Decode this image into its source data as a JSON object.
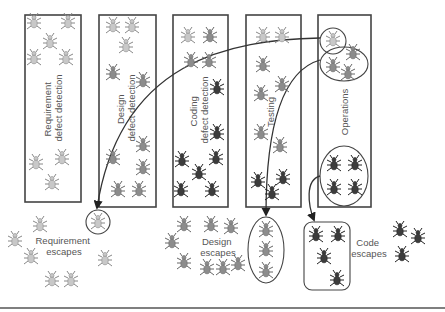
{
  "phases": [
    {
      "id": "requirement",
      "label_lines": [
        "Requirement",
        "defect detection"
      ]
    },
    {
      "id": "design",
      "label_lines": [
        "Design",
        "defect detection"
      ]
    },
    {
      "id": "coding",
      "label_lines": [
        "Coding",
        "defect detection"
      ]
    },
    {
      "id": "testing",
      "label_lines": [
        "Testing"
      ]
    },
    {
      "id": "operations",
      "label_lines": [
        "Operations"
      ]
    }
  ],
  "escapes": [
    {
      "id": "requirement",
      "label_lines": [
        "Requirement",
        "escapes"
      ]
    },
    {
      "id": "design",
      "label_lines": [
        "Design",
        "escapes"
      ]
    },
    {
      "id": "code",
      "label_lines": [
        "Code",
        "escapes"
      ]
    }
  ],
  "bug_colors": {
    "requirement": "#c8c8c8",
    "design": "#8c8c8c",
    "code": "#3c3c3c"
  },
  "bugs": [
    {
      "g": "requirement",
      "box": "requirement",
      "p": [
        34,
        22
      ]
    },
    {
      "g": "requirement",
      "box": "requirement",
      "p": [
        68,
        22
      ]
    },
    {
      "g": "requirement",
      "box": "requirement",
      "p": [
        50,
        42
      ]
    },
    {
      "g": "requirement",
      "box": "requirement",
      "p": [
        34,
        58
      ]
    },
    {
      "g": "requirement",
      "box": "requirement",
      "p": [
        66,
        58
      ]
    },
    {
      "g": "requirement",
      "box": "requirement",
      "p": [
        36,
        163
      ]
    },
    {
      "g": "requirement",
      "box": "requirement",
      "p": [
        62,
        158
      ]
    },
    {
      "g": "requirement",
      "box": "requirement",
      "p": [
        52,
        183
      ]
    },
    {
      "g": "requirement",
      "box": "design",
      "p": [
        113,
        26
      ]
    },
    {
      "g": "requirement",
      "box": "design",
      "p": [
        132,
        26
      ]
    },
    {
      "g": "requirement",
      "box": "design",
      "p": [
        126,
        46
      ]
    },
    {
      "g": "design",
      "box": "design",
      "p": [
        113,
        73
      ]
    },
    {
      "g": "design",
      "box": "design",
      "p": [
        143,
        81
      ]
    },
    {
      "g": "design",
      "box": "design",
      "p": [
        113,
        158
      ]
    },
    {
      "g": "design",
      "box": "design",
      "p": [
        143,
        145
      ]
    },
    {
      "g": "design",
      "box": "design",
      "p": [
        143,
        168
      ]
    },
    {
      "g": "design",
      "box": "design",
      "p": [
        118,
        190
      ]
    },
    {
      "g": "design",
      "box": "design",
      "p": [
        139,
        190
      ]
    },
    {
      "g": "requirement",
      "box": "coding",
      "p": [
        188,
        36
      ]
    },
    {
      "g": "design",
      "box": "coding",
      "p": [
        210,
        36
      ]
    },
    {
      "g": "design",
      "box": "coding",
      "p": [
        191,
        61
      ]
    },
    {
      "g": "design",
      "box": "coding",
      "p": [
        209,
        61
      ]
    },
    {
      "g": "code",
      "box": "coding",
      "p": [
        217,
        88
      ]
    },
    {
      "g": "code",
      "box": "coding",
      "p": [
        217,
        133
      ]
    },
    {
      "g": "code",
      "box": "coding",
      "p": [
        216,
        158
      ]
    },
    {
      "g": "code",
      "box": "coding",
      "p": [
        182,
        160
      ]
    },
    {
      "g": "code",
      "box": "coding",
      "p": [
        199,
        173
      ]
    },
    {
      "g": "code",
      "box": "coding",
      "p": [
        181,
        190
      ]
    },
    {
      "g": "code",
      "box": "coding",
      "p": [
        212,
        190
      ]
    },
    {
      "g": "requirement",
      "box": "testing",
      "p": [
        263,
        36
      ]
    },
    {
      "g": "requirement",
      "box": "testing",
      "p": [
        282,
        36
      ]
    },
    {
      "g": "design",
      "box": "testing",
      "p": [
        263,
        65
      ]
    },
    {
      "g": "design",
      "box": "testing",
      "p": [
        282,
        85
      ]
    },
    {
      "g": "design",
      "box": "testing",
      "p": [
        261,
        94
      ]
    },
    {
      "g": "design",
      "box": "testing",
      "p": [
        261,
        133
      ]
    },
    {
      "g": "design",
      "box": "testing",
      "p": [
        280,
        146
      ]
    },
    {
      "g": "code",
      "box": "testing",
      "p": [
        258,
        181
      ]
    },
    {
      "g": "code",
      "box": "testing",
      "p": [
        283,
        178
      ]
    },
    {
      "g": "code",
      "box": "testing",
      "p": [
        272,
        193
      ]
    },
    {
      "g": "requirement",
      "box": "operations",
      "p": [
        333,
        40
      ]
    },
    {
      "g": "design",
      "box": "operations",
      "p": [
        353,
        53
      ]
    },
    {
      "g": "design",
      "box": "operations",
      "p": [
        333,
        66
      ]
    },
    {
      "g": "design",
      "box": "operations",
      "p": [
        348,
        73
      ]
    },
    {
      "g": "code",
      "box": "operations",
      "p": [
        334,
        164
      ]
    },
    {
      "g": "code",
      "box": "operations",
      "p": [
        355,
        164
      ]
    },
    {
      "g": "code",
      "box": "operations",
      "p": [
        334,
        188
      ]
    },
    {
      "g": "code",
      "box": "operations",
      "p": [
        355,
        188
      ]
    },
    {
      "g": "requirement",
      "box": "req-escape",
      "p": [
        98,
        222
      ]
    },
    {
      "g": "requirement",
      "box": "req-escape",
      "p": [
        40,
        225
      ]
    },
    {
      "g": "requirement",
      "box": "req-escape",
      "p": [
        15,
        240
      ]
    },
    {
      "g": "requirement",
      "box": "req-escape",
      "p": [
        31,
        257
      ]
    },
    {
      "g": "requirement",
      "box": "req-escape",
      "p": [
        105,
        259
      ]
    },
    {
      "g": "requirement",
      "box": "req-escape",
      "p": [
        52,
        280
      ]
    },
    {
      "g": "requirement",
      "box": "req-escape",
      "p": [
        71,
        280
      ]
    },
    {
      "g": "design",
      "box": "design-escape",
      "p": [
        184,
        225
      ]
    },
    {
      "g": "design",
      "box": "design-escape",
      "p": [
        211,
        225
      ]
    },
    {
      "g": "design",
      "box": "design-escape",
      "p": [
        231,
        227
      ]
    },
    {
      "g": "design",
      "box": "design-escape",
      "p": [
        172,
        242
      ]
    },
    {
      "g": "design",
      "box": "design-escape",
      "p": [
        184,
        262
      ]
    },
    {
      "g": "design",
      "box": "design-escape",
      "p": [
        207,
        268
      ]
    },
    {
      "g": "design",
      "box": "design-escape",
      "p": [
        223,
        268
      ]
    },
    {
      "g": "design",
      "box": "design-escape",
      "p": [
        238,
        264
      ]
    },
    {
      "g": "design",
      "box": "design-escape",
      "p": [
        266,
        230
      ]
    },
    {
      "g": "design",
      "box": "design-escape",
      "p": [
        266,
        250
      ]
    },
    {
      "g": "design",
      "box": "design-escape",
      "p": [
        266,
        271
      ]
    },
    {
      "g": "code",
      "box": "code-escape",
      "p": [
        316,
        235
      ]
    },
    {
      "g": "code",
      "box": "code-escape",
      "p": [
        338,
        235
      ]
    },
    {
      "g": "code",
      "box": "code-escape",
      "p": [
        324,
        257
      ]
    },
    {
      "g": "code",
      "box": "code-escape",
      "p": [
        337,
        279
      ]
    },
    {
      "g": "code",
      "box": "code-escape",
      "p": [
        400,
        230
      ]
    },
    {
      "g": "code",
      "box": "code-escape",
      "p": [
        418,
        237
      ]
    },
    {
      "g": "code",
      "box": "code-escape",
      "p": [
        402,
        255
      ]
    }
  ]
}
